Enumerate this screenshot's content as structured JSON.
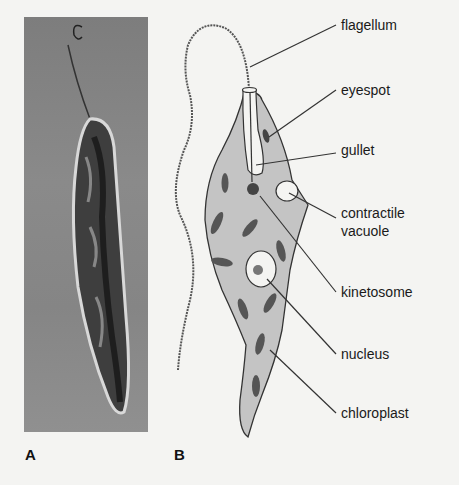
{
  "figure": {
    "panels": [
      {
        "id": "A",
        "label": "A",
        "content": "phase-contrast micrograph of Euglena"
      },
      {
        "id": "B",
        "label": "B",
        "content": "labeled drawing of Euglena"
      }
    ],
    "labels": {
      "flagellum": "flagellum",
      "eyespot": "eyespot",
      "gullet": "gullet",
      "contractile_vacuole_line1": "contractile",
      "contractile_vacuole_line2": "vacuole",
      "kinetosome": "kinetosome",
      "nucleus": "nucleus",
      "chloroplast": "chloroplast"
    },
    "colors": {
      "background": "#f4f4f2",
      "cell_fill": "#c4c4c4",
      "organelle": "#555555",
      "outline": "#333333"
    }
  }
}
